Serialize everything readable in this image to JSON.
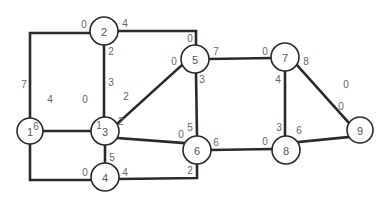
{
  "diagram": {
    "type": "network-graph",
    "colors": {
      "edge": "#2a2a2a",
      "node_stroke": "#2a2a2a",
      "text": "#555555",
      "background": "#ffffff"
    },
    "nodes": [
      {
        "id": "1",
        "label": "1",
        "x": 30,
        "y": 131,
        "r": 13
      },
      {
        "id": "2",
        "label": "2",
        "x": 104,
        "y": 31,
        "r": 14
      },
      {
        "id": "3",
        "label": "3",
        "x": 105,
        "y": 131,
        "r": 14
      },
      {
        "id": "4",
        "label": "4",
        "x": 105,
        "y": 177,
        "r": 14
      },
      {
        "id": "5",
        "label": "5",
        "x": 195,
        "y": 59,
        "r": 14
      },
      {
        "id": "6",
        "label": "6",
        "x": 197,
        "y": 150,
        "r": 14
      },
      {
        "id": "7",
        "label": "7",
        "x": 285,
        "y": 57,
        "r": 14
      },
      {
        "id": "8",
        "label": "8",
        "x": 286,
        "y": 150,
        "r": 14
      },
      {
        "id": "9",
        "label": "9",
        "x": 360,
        "y": 130,
        "r": 13
      }
    ],
    "edges": [
      {
        "from": "1",
        "to": "2",
        "path": "M30,118 L30,33 L90,33",
        "from_label": "7",
        "to_label": "0"
      },
      {
        "from": "1",
        "to": "3",
        "path": "M43,131 L91,131",
        "from_label": "4",
        "to_label": "0"
      },
      {
        "from": "1",
        "to": "4",
        "path": "M30,144 L30,180 L91,180",
        "from_label": "6",
        "to_label": "0"
      },
      {
        "from": "2",
        "to": "3",
        "path": "M104,45 L104,117",
        "from_label": "2",
        "to_label": "3"
      },
      {
        "from": "2",
        "to": "5",
        "path": "M118,31 L196,31 L196,45",
        "from_label": "4",
        "to_label": "0"
      },
      {
        "from": "3",
        "to": "5",
        "path": "M117,124 L182,65",
        "from_label": "2",
        "to_label": "0"
      },
      {
        "from": "3",
        "to": "6",
        "path": "M118,138 L184,143",
        "from_label": "2",
        "to_label": "0"
      },
      {
        "from": "3",
        "to": "4",
        "path": "M105,145 L105,163",
        "from_label": "1",
        "to_label": "5"
      },
      {
        "from": "4",
        "to": "6",
        "path": "M119,179 L197,178 L197,164",
        "from_label": "4",
        "to_label": "2"
      },
      {
        "from": "5",
        "to": "6",
        "path": "M196,73 L197,136",
        "from_label": "3",
        "to_label": "5"
      },
      {
        "from": "5",
        "to": "7",
        "path": "M209,59 L271,58",
        "from_label": "7",
        "to_label": "0"
      },
      {
        "from": "6",
        "to": "8",
        "path": "M211,150 L272,149",
        "from_label": "6",
        "to_label": "0"
      },
      {
        "from": "7",
        "to": "8",
        "path": "M285,71 L285,136",
        "from_label": "4",
        "to_label": "3"
      },
      {
        "from": "7",
        "to": "9",
        "path": "M297,65 L348,122",
        "from_label": "8",
        "to_label": "0"
      },
      {
        "from": "8",
        "to": "9",
        "path": "M298,142 L349,137",
        "from_label": "6",
        "to_label": "0"
      }
    ],
    "port_labels": [
      {
        "text": "7",
        "x": 24,
        "y": 84
      },
      {
        "text": "0",
        "x": 84,
        "y": 24
      },
      {
        "text": "4",
        "x": 125,
        "y": 23
      },
      {
        "text": "2",
        "x": 111,
        "y": 51
      },
      {
        "text": "4",
        "x": 50,
        "y": 99
      },
      {
        "text": "0",
        "x": 85,
        "y": 99
      },
      {
        "text": "3",
        "x": 111,
        "y": 82
      },
      {
        "text": "2",
        "x": 126,
        "y": 96
      },
      {
        "text": "2",
        "x": 121,
        "y": 121
      },
      {
        "text": "6",
        "x": 36,
        "y": 126
      },
      {
        "text": "1",
        "x": 99,
        "y": 125
      },
      {
        "text": "5",
        "x": 112,
        "y": 157
      },
      {
        "text": "0",
        "x": 85,
        "y": 172
      },
      {
        "text": "4",
        "x": 125,
        "y": 172
      },
      {
        "text": "0",
        "x": 190,
        "y": 38
      },
      {
        "text": "0",
        "x": 174,
        "y": 61
      },
      {
        "text": "7",
        "x": 216,
        "y": 51
      },
      {
        "text": "3",
        "x": 202,
        "y": 79
      },
      {
        "text": "5",
        "x": 190,
        "y": 127
      },
      {
        "text": "0",
        "x": 181,
        "y": 134
      },
      {
        "text": "6",
        "x": 216,
        "y": 142
      },
      {
        "text": "2",
        "x": 190,
        "y": 170
      },
      {
        "text": "0",
        "x": 265,
        "y": 51
      },
      {
        "text": "8",
        "x": 306,
        "y": 61
      },
      {
        "text": "4",
        "x": 278,
        "y": 79
      },
      {
        "text": "0",
        "x": 346,
        "y": 84
      },
      {
        "text": "0",
        "x": 341,
        "y": 106
      },
      {
        "text": "3",
        "x": 279,
        "y": 127
      },
      {
        "text": "6",
        "x": 299,
        "y": 130
      },
      {
        "text": "0",
        "x": 265,
        "y": 141
      }
    ]
  }
}
